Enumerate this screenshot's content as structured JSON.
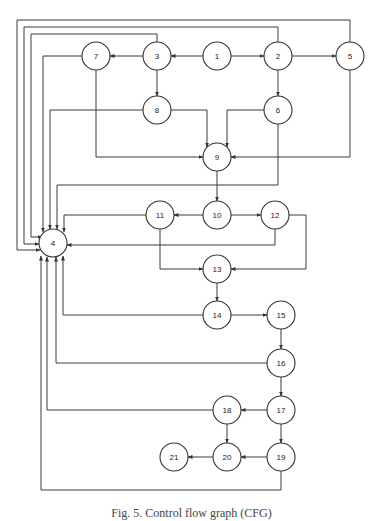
{
  "diagram": {
    "type": "control-flow-graph",
    "caption": "Fig. 5. Control flow graph (CFG)",
    "node_radius": 14,
    "colors": {
      "stroke": "#333333",
      "fill": "#ffffff",
      "text": "#222222"
    },
    "nodes": [
      {
        "id": "1",
        "label": "1",
        "x": 217,
        "y": 56
      },
      {
        "id": "2",
        "label": "2",
        "x": 278,
        "y": 56
      },
      {
        "id": "3",
        "label": "3",
        "x": 157,
        "y": 56
      },
      {
        "id": "4",
        "label": "4",
        "x": 53,
        "y": 243
      },
      {
        "id": "5",
        "label": "5",
        "x": 350,
        "y": 56
      },
      {
        "id": "6",
        "label": "6",
        "x": 278,
        "y": 110
      },
      {
        "id": "7",
        "label": "7",
        "x": 96,
        "y": 56
      },
      {
        "id": "8",
        "label": "8",
        "x": 157,
        "y": 110
      },
      {
        "id": "9",
        "label": "9",
        "x": 217,
        "y": 157
      },
      {
        "id": "10",
        "label": "10",
        "x": 217,
        "y": 215
      },
      {
        "id": "11",
        "label": "11",
        "x": 160,
        "y": 215
      },
      {
        "id": "12",
        "label": "12",
        "x": 275,
        "y": 215
      },
      {
        "id": "13",
        "label": "13",
        "x": 217,
        "y": 269
      },
      {
        "id": "14",
        "label": "14",
        "x": 217,
        "y": 315
      },
      {
        "id": "15",
        "label": "15",
        "x": 281,
        "y": 315
      },
      {
        "id": "16",
        "label": "16",
        "x": 281,
        "y": 363
      },
      {
        "id": "17",
        "label": "17",
        "x": 281,
        "y": 410
      },
      {
        "id": "18",
        "label": "18",
        "x": 227,
        "y": 410
      },
      {
        "id": "19",
        "label": "19",
        "x": 281,
        "y": 457
      },
      {
        "id": "20",
        "label": "20",
        "x": 227,
        "y": 457
      },
      {
        "id": "21",
        "label": "21",
        "x": 174,
        "y": 457
      }
    ],
    "edges": [
      {
        "from": "1",
        "to": "3",
        "points": [
          [
            203,
            56
          ],
          [
            171,
            56
          ]
        ]
      },
      {
        "from": "1",
        "to": "2",
        "points": [
          [
            231,
            56
          ],
          [
            264,
            56
          ]
        ]
      },
      {
        "from": "3",
        "to": "7",
        "points": [
          [
            143,
            56
          ],
          [
            110,
            56
          ]
        ]
      },
      {
        "from": "2",
        "to": "5",
        "points": [
          [
            292,
            56
          ],
          [
            336,
            56
          ]
        ]
      },
      {
        "from": "3",
        "to": "8",
        "points": [
          [
            157,
            70
          ],
          [
            157,
            96
          ]
        ]
      },
      {
        "from": "2",
        "to": "6",
        "points": [
          [
            278,
            70
          ],
          [
            278,
            96
          ]
        ]
      },
      {
        "from": "5",
        "to": "4",
        "points": [
          [
            350,
            42
          ],
          [
            350,
            20
          ],
          [
            17,
            20
          ],
          [
            17,
            250
          ],
          [
            40,
            250
          ]
        ]
      },
      {
        "from": "2",
        "to": "4",
        "points": [
          [
            278,
            42
          ],
          [
            278,
            27
          ],
          [
            24,
            27
          ],
          [
            24,
            244
          ],
          [
            39,
            244
          ]
        ]
      },
      {
        "from": "3",
        "to": "4",
        "points": [
          [
            157,
            42
          ],
          [
            157,
            34
          ],
          [
            31,
            34
          ],
          [
            31,
            237
          ],
          [
            42,
            237
          ]
        ]
      },
      {
        "from": "7",
        "to": "4",
        "points": [
          [
            82,
            56
          ],
          [
            43,
            56
          ],
          [
            43,
            232
          ]
        ]
      },
      {
        "from": "8",
        "to": "4",
        "points": [
          [
            143,
            110
          ],
          [
            50,
            110
          ],
          [
            50,
            229
          ]
        ]
      },
      {
        "from": "6",
        "to": "4",
        "points": [
          [
            278,
            124
          ],
          [
            278,
            185
          ],
          [
            57,
            185
          ],
          [
            57,
            229
          ]
        ]
      },
      {
        "from": "7",
        "to": "9",
        "points": [
          [
            96,
            70
          ],
          [
            96,
            157
          ],
          [
            203,
            157
          ]
        ]
      },
      {
        "from": "8",
        "to": "9",
        "points": [
          [
            171,
            110
          ],
          [
            207,
            110
          ],
          [
            207,
            147
          ]
        ]
      },
      {
        "from": "6",
        "to": "9",
        "points": [
          [
            264,
            110
          ],
          [
            227,
            110
          ],
          [
            227,
            147
          ]
        ]
      },
      {
        "from": "5",
        "to": "9",
        "points": [
          [
            350,
            70
          ],
          [
            350,
            157
          ],
          [
            231,
            157
          ]
        ]
      },
      {
        "from": "9",
        "to": "10",
        "points": [
          [
            217,
            171
          ],
          [
            217,
            201
          ]
        ]
      },
      {
        "from": "10",
        "to": "11",
        "points": [
          [
            203,
            215
          ],
          [
            174,
            215
          ]
        ]
      },
      {
        "from": "10",
        "to": "12",
        "points": [
          [
            231,
            215
          ],
          [
            261,
            215
          ]
        ]
      },
      {
        "from": "11",
        "to": "4",
        "points": [
          [
            146,
            215
          ],
          [
            64,
            215
          ],
          [
            64,
            232
          ]
        ]
      },
      {
        "from": "12",
        "to": "4",
        "points": [
          [
            275,
            229
          ],
          [
            275,
            245
          ],
          [
            67,
            245
          ]
        ]
      },
      {
        "from": "11",
        "to": "13",
        "points": [
          [
            160,
            229
          ],
          [
            160,
            269
          ],
          [
            203,
            269
          ]
        ]
      },
      {
        "from": "12",
        "to": "13",
        "points": [
          [
            289,
            215
          ],
          [
            306,
            215
          ],
          [
            306,
            269
          ],
          [
            231,
            269
          ]
        ]
      },
      {
        "from": "13",
        "to": "14",
        "points": [
          [
            217,
            283
          ],
          [
            217,
            301
          ]
        ]
      },
      {
        "from": "14",
        "to": "15",
        "points": [
          [
            231,
            315
          ],
          [
            267,
            315
          ]
        ]
      },
      {
        "from": "14",
        "to": "4",
        "points": [
          [
            203,
            315
          ],
          [
            63,
            315
          ],
          [
            63,
            256
          ]
        ]
      },
      {
        "from": "15",
        "to": "16",
        "points": [
          [
            281,
            329
          ],
          [
            281,
            349
          ]
        ]
      },
      {
        "from": "16",
        "to": "4",
        "points": [
          [
            267,
            363
          ],
          [
            56,
            363
          ],
          [
            56,
            257
          ]
        ]
      },
      {
        "from": "16",
        "to": "17",
        "points": [
          [
            281,
            377
          ],
          [
            281,
            396
          ]
        ]
      },
      {
        "from": "17",
        "to": "18",
        "points": [
          [
            267,
            410
          ],
          [
            241,
            410
          ]
        ]
      },
      {
        "from": "17",
        "to": "19",
        "points": [
          [
            281,
            424
          ],
          [
            281,
            443
          ]
        ]
      },
      {
        "from": "18",
        "to": "4",
        "points": [
          [
            213,
            410
          ],
          [
            47,
            410
          ],
          [
            47,
            257
          ]
        ]
      },
      {
        "from": "18",
        "to": "20",
        "points": [
          [
            227,
            424
          ],
          [
            227,
            443
          ]
        ]
      },
      {
        "from": "19",
        "to": "20",
        "points": [
          [
            267,
            457
          ],
          [
            241,
            457
          ]
        ]
      },
      {
        "from": "20",
        "to": "21",
        "points": [
          [
            213,
            457
          ],
          [
            188,
            457
          ]
        ]
      },
      {
        "from": "19",
        "to": "4",
        "points": [
          [
            281,
            471
          ],
          [
            281,
            490
          ],
          [
            41,
            490
          ],
          [
            41,
            256
          ]
        ]
      }
    ]
  }
}
